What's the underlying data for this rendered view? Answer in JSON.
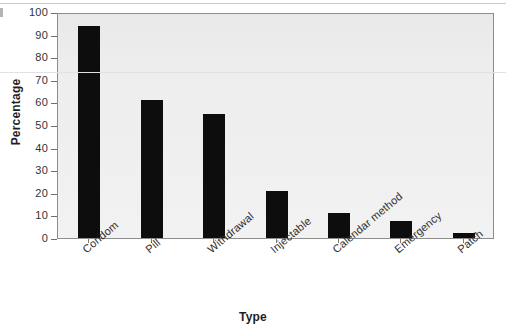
{
  "chart_data": {
    "type": "bar",
    "title": "",
    "xlabel": "Type",
    "ylabel": "Percentage",
    "categories": [
      "Condom",
      "Pill",
      "Withdrawal",
      "Injectable",
      "Calendar method",
      "Emergency",
      "Patch"
    ],
    "values": [
      94,
      61,
      55,
      21,
      11,
      7.5,
      2
    ],
    "ylim": [
      0,
      100
    ],
    "ytick_values": [
      0,
      10,
      20,
      30,
      40,
      50,
      60,
      70,
      80,
      90,
      100
    ],
    "ytick_labels": [
      "0",
      "10",
      "20",
      "30",
      "40",
      "50",
      "60",
      "70",
      "80",
      "90",
      "100"
    ],
    "grid": false,
    "legend": "none",
    "bar_color": "#0d0d0d",
    "plot_background": "#ededed"
  }
}
